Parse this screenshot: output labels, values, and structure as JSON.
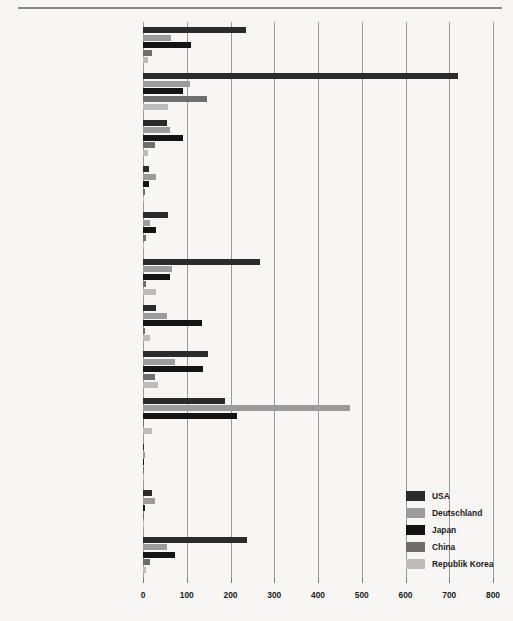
{
  "chart_data": {
    "type": "bar",
    "orientation": "horizontal",
    "title": "",
    "xlabel": "",
    "ylabel": "",
    "xlim": [
      0,
      800
    ],
    "xticks": [
      0,
      100,
      200,
      300,
      400,
      500,
      600,
      700,
      800
    ],
    "xtick_labels": [
      "0",
      "100",
      "200",
      "300",
      "400",
      "500",
      "600",
      "700",
      "800"
    ],
    "grid": true,
    "legend_position": "bottom-right",
    "categories": [
      "Kerngebiete",
      "Computer",
      "Erkennungssysteme/Diagnose",
      "Sprachanalyse/Synthese",
      "Bildanalyse",
      "Medizintechnik",
      "Robotik",
      "Steuern und Regeln allgemein",
      "Verkehrs-/Fahrzeugtechnik",
      "Unterricht/Modelle",
      "Kommunikation",
      "Geschäftsmodelle/Prognosen"
    ],
    "series": [
      {
        "name": "USA",
        "color": "#2b2b2b",
        "values": [
          236,
          719,
          54,
          13,
          57,
          267,
          30,
          149,
          187,
          3,
          20,
          237
        ]
      },
      {
        "name": "Deutschland",
        "color": "#9b9b9b",
        "values": [
          63,
          107,
          62,
          30,
          16,
          66,
          54,
          74,
          472,
          4,
          27,
          55
        ]
      },
      {
        "name": "Japan",
        "color": "#141414",
        "values": [
          110,
          92,
          92,
          13,
          30,
          62,
          134,
          137,
          214,
          2,
          5,
          72
        ]
      },
      {
        "name": "China",
        "color": "#6e6e6e",
        "values": [
          21,
          146,
          27,
          4,
          7,
          7,
          4,
          27,
          3,
          2,
          2,
          17
        ]
      },
      {
        "name": "Republik Korea",
        "color": "#bcbcbc",
        "values": [
          12,
          58,
          12,
          3,
          3,
          30,
          16,
          34,
          20,
          2,
          2,
          6
        ]
      }
    ]
  },
  "legend": {
    "entries": [
      {
        "label": "USA",
        "color": "#2b2b2b"
      },
      {
        "label": "Deutschland",
        "color": "#9b9b9b"
      },
      {
        "label": "Japan",
        "color": "#141414"
      },
      {
        "label": "China",
        "color": "#6e6e6e"
      },
      {
        "label": "Republik Korea",
        "color": "#bcbcbc"
      }
    ]
  }
}
